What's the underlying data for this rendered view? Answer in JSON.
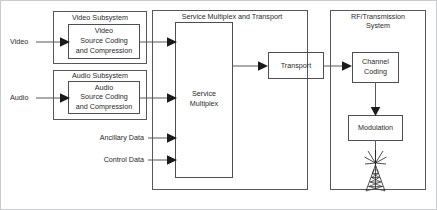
{
  "diagram": {
    "groups": [
      {
        "id": "video-subsystem",
        "label": "Video Subsystem"
      },
      {
        "id": "audio-subsystem",
        "label": "Audio Subsystem"
      },
      {
        "id": "service-multiplex-and-transport",
        "label": "Service Multiplex and Transport"
      },
      {
        "id": "rf-transmission-system",
        "label_line1": "RF/Transmission",
        "label_line2": "System"
      }
    ],
    "blocks": [
      {
        "id": "video-source-coding",
        "line1": "Video",
        "line2": "Source Coding",
        "line3": "and Compression"
      },
      {
        "id": "audio-source-coding",
        "line1": "Audio",
        "line2": "Source Coding",
        "line3": "and Compression"
      },
      {
        "id": "service-multiplex",
        "line1": "Service",
        "line2": "Multiplex"
      },
      {
        "id": "transport",
        "line1": "Transport"
      },
      {
        "id": "channel-coding",
        "line1": "Channel",
        "line2": "Coding"
      },
      {
        "id": "modulation",
        "line1": "Modulation"
      }
    ],
    "inputs": [
      {
        "id": "video-input",
        "label": "Video"
      },
      {
        "id": "audio-input",
        "label": "Audio"
      },
      {
        "id": "ancillary-data-input",
        "label": "Ancillary Data"
      },
      {
        "id": "control-data-input",
        "label": "Control Data"
      }
    ],
    "icons": [
      {
        "id": "transmission-antenna-icon",
        "name": "antenna-tower-icon"
      }
    ],
    "colors": {
      "background": "#ffffff",
      "box_stroke": "#55575a",
      "line_stroke": "#58595c",
      "arrow_fill": "#1b1b1b",
      "text": "#2a2a2c",
      "frame_stroke": "#c9cbcd"
    }
  }
}
